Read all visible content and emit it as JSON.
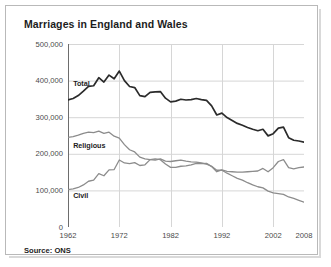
{
  "chart_data": {
    "type": "line",
    "title": "Marriages in England and Wales",
    "xlabel": "",
    "ylabel": "",
    "source": "Source: ONS",
    "grid": true,
    "legend_position": "inline-labels",
    "xlim": [
      1962,
      2008
    ],
    "ylim": [
      0,
      500000
    ],
    "xticks": [
      "1962",
      "1972",
      "1982",
      "1992",
      "2002",
      "2008"
    ],
    "xtick_values": [
      1962,
      1972,
      1982,
      1992,
      2002,
      2008
    ],
    "yticks": [
      "0",
      "100,000",
      "200,000",
      "300,000",
      "400,000",
      "500,000"
    ],
    "ytick_values": [
      0,
      100000,
      200000,
      300000,
      400000,
      500000
    ],
    "x": [
      1962,
      1963,
      1964,
      1965,
      1966,
      1967,
      1968,
      1969,
      1970,
      1971,
      1972,
      1973,
      1974,
      1975,
      1976,
      1977,
      1978,
      1979,
      1980,
      1981,
      1982,
      1983,
      1984,
      1985,
      1986,
      1987,
      1988,
      1989,
      1990,
      1991,
      1992,
      1993,
      1994,
      1995,
      1996,
      1997,
      1998,
      1999,
      2000,
      2001,
      2002,
      2003,
      2004,
      2005,
      2006,
      2007,
      2008
    ],
    "series": [
      {
        "name": "Total",
        "color": "#2b2b2b",
        "width": 1.7,
        "label_x": 1963,
        "label_y": 392000,
        "values": [
          347000,
          351000,
          359000,
          371000,
          384000,
          386000,
          408000,
          396000,
          415000,
          405000,
          426000,
          400000,
          384000,
          381000,
          359000,
          356000,
          368000,
          369000,
          370000,
          352000,
          342000,
          344000,
          349000,
          347000,
          348000,
          351000,
          348000,
          346000,
          331000,
          306000,
          311000,
          299000,
          291000,
          283000,
          278000,
          272000,
          267000,
          263000,
          267000,
          249000,
          255000,
          270000,
          273000,
          244000,
          237000,
          235000,
          232000
        ]
      },
      {
        "name": "Religious",
        "color": "#8c8c8c",
        "width": 1.3,
        "label_x": 1963,
        "label_y": 222000,
        "values": [
          245000,
          247000,
          251000,
          256000,
          259000,
          258000,
          262000,
          256000,
          259000,
          248000,
          243000,
          225000,
          211000,
          205000,
          191000,
          186000,
          184000,
          183000,
          186000,
          180000,
          179000,
          181000,
          183000,
          180000,
          178000,
          177000,
          175000,
          172000,
          166000,
          155000,
          155000,
          147000,
          140000,
          133000,
          128000,
          121000,
          115000,
          110000,
          107000,
          98000,
          93000,
          91000,
          89000,
          82000,
          78000,
          73000,
          68000
        ]
      },
      {
        "name": "Civil",
        "color": "#8c8c8c",
        "width": 1.3,
        "label_x": 1963,
        "label_y": 85000,
        "values": [
          102000,
          104000,
          108000,
          115000,
          125000,
          128000,
          146000,
          140000,
          156000,
          157000,
          183000,
          175000,
          173000,
          176000,
          168000,
          170000,
          184000,
          186000,
          184000,
          172000,
          163000,
          163000,
          166000,
          167000,
          170000,
          174000,
          173000,
          174000,
          165000,
          151000,
          156000,
          152000,
          151000,
          150000,
          150000,
          151000,
          152000,
          153000,
          160000,
          151000,
          162000,
          179000,
          184000,
          162000,
          159000,
          162000,
          164000
        ]
      }
    ]
  }
}
